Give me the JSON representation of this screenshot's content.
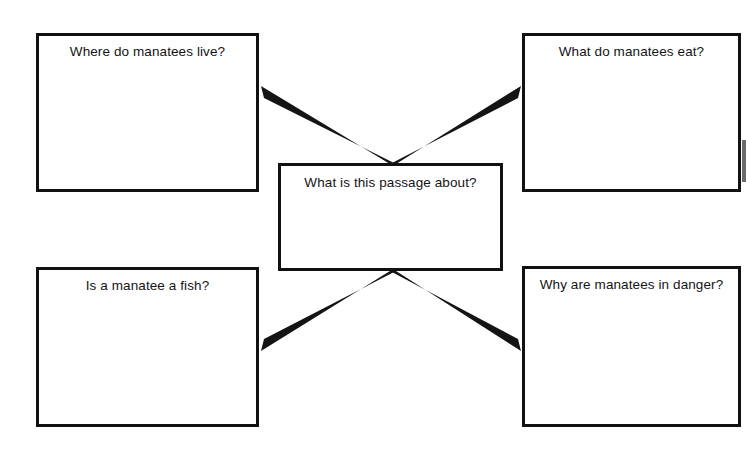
{
  "worksheet": {
    "type": "graphic-organizer",
    "topic": "manatees",
    "center": {
      "id": "center",
      "label": "What is this passage about?",
      "x": 278,
      "y": 163,
      "width": 225,
      "height": 108
    },
    "branches": [
      {
        "id": "top-left",
        "label": "Where do manatees live?",
        "x": 36,
        "y": 33,
        "width": 223,
        "height": 159
      },
      {
        "id": "top-right",
        "label": "What do manatees eat?",
        "x": 522,
        "y": 33,
        "width": 219,
        "height": 159
      },
      {
        "id": "bottom-left",
        "label": "Is a manatee a fish?",
        "x": 36,
        "y": 267,
        "width": 223,
        "height": 160
      },
      {
        "id": "bottom-right",
        "label": "Why are manatees in danger?",
        "x": 522,
        "y": 266,
        "width": 219,
        "height": 161
      }
    ],
    "connectors": [
      {
        "id": "center-to-top-left",
        "from": [
          393,
          163
        ],
        "to": [
          261,
          92
        ]
      },
      {
        "id": "center-to-top-right",
        "from": [
          393,
          163
        ],
        "to": [
          521,
          92
        ]
      },
      {
        "id": "center-to-bottom-left",
        "from": [
          393,
          272
        ],
        "to": [
          261,
          345
        ]
      },
      {
        "id": "center-to-bottom-right",
        "from": [
          393,
          272
        ],
        "to": [
          521,
          345
        ]
      }
    ],
    "colors": {
      "ink": "#111111",
      "paper": "#ffffff",
      "line": "#141414"
    }
  }
}
